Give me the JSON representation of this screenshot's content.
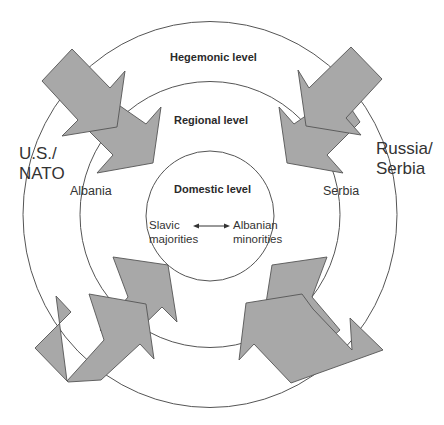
{
  "levels": {
    "hegemonic": "Hegemonic level",
    "regional": "Regional level",
    "domestic": "Domestic level"
  },
  "actors": {
    "left_hegemon": [
      "U.S./",
      "NATO"
    ],
    "right_hegemon": [
      "Russia/",
      "Serbia"
    ],
    "left_regional": "Albania",
    "right_regional": "Serbia"
  },
  "domestic_relation": {
    "left": [
      "Slavic",
      "majorities"
    ],
    "right": [
      "Albanian",
      "minorities"
    ],
    "connector": "double-headed-arrow"
  },
  "colors": {
    "arrow_fill": "#a8a8a8",
    "stroke": "#555555",
    "text": "#333333"
  }
}
